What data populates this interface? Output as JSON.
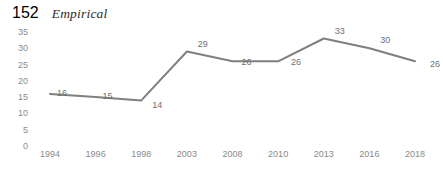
{
  "running_head": {
    "page_number": "152",
    "title": "Empirical"
  },
  "chart_data": {
    "type": "line",
    "title": "",
    "subtitle": "",
    "xlabel": "",
    "ylabel": "",
    "categories": [
      "1994",
      "1996",
      "1998",
      "2003",
      "2008",
      "2010",
      "2013",
      "2016",
      "2018"
    ],
    "values": [
      16,
      15,
      14,
      29,
      26,
      26,
      33,
      30,
      26
    ],
    "point_labels": [
      "16",
      "15",
      "14",
      "29",
      "26",
      "26",
      "33",
      "30",
      "26"
    ],
    "series": [
      {
        "name": "",
        "values": [
          16,
          15,
          14,
          29,
          26,
          26,
          33,
          30,
          26
        ]
      }
    ],
    "ylim": [
      0,
      35
    ],
    "yticks": [
      "0",
      "5",
      "10",
      "15",
      "20",
      "25",
      "30",
      "35"
    ],
    "ytick_values": [
      0,
      5,
      10,
      15,
      20,
      25,
      30,
      35
    ],
    "grid": false,
    "axis_lines": false,
    "legend": false,
    "legend_position": "none",
    "markers": false,
    "line_color": "#7f7f7f",
    "line_width": 2,
    "label_color": "#6f6f6f",
    "tick_color": "#8a8a8a",
    "background_color": "#ffffff"
  }
}
